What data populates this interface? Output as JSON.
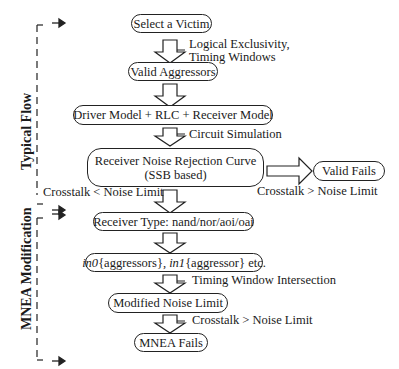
{
  "side_labels": {
    "typical_flow": "Typical Flow",
    "mnea_modification": "MNEA Modification"
  },
  "nodes": {
    "select_victim": "Select a Victim",
    "valid_aggressors": "Valid Aggressors",
    "models": "Driver Model + RLC + Receiver Model",
    "rejection_curve_line1": "Receiver Noise Rejection Curve",
    "rejection_curve_line2": "(SSB based)",
    "valid_fails": "Valid Fails",
    "receiver_type": "Receiver Type: nand/nor/aoi/oai",
    "pin_mapping_in0": "in0",
    "pin_mapping_mid": "{aggressors}, ",
    "pin_mapping_in1": "in1",
    "pin_mapping_tail": "{aggressor} etc.",
    "modified_noise_limit": "Modified Noise Limit",
    "mnea_fails": "MNEA Fails"
  },
  "edge_labels": {
    "logical_exclusivity": "Logical Exclusivity,",
    "timing_windows": "Timing Windows",
    "circuit_simulation": "Circuit Simulation",
    "crosstalk_lt": "Crosstalk < Noise Limit",
    "crosstalk_gt_right": "Crosstalk > Noise Limit",
    "timing_window_intersection": "Timing Window Intersection",
    "crosstalk_gt_bottom": "Crosstalk > Noise Limit"
  }
}
